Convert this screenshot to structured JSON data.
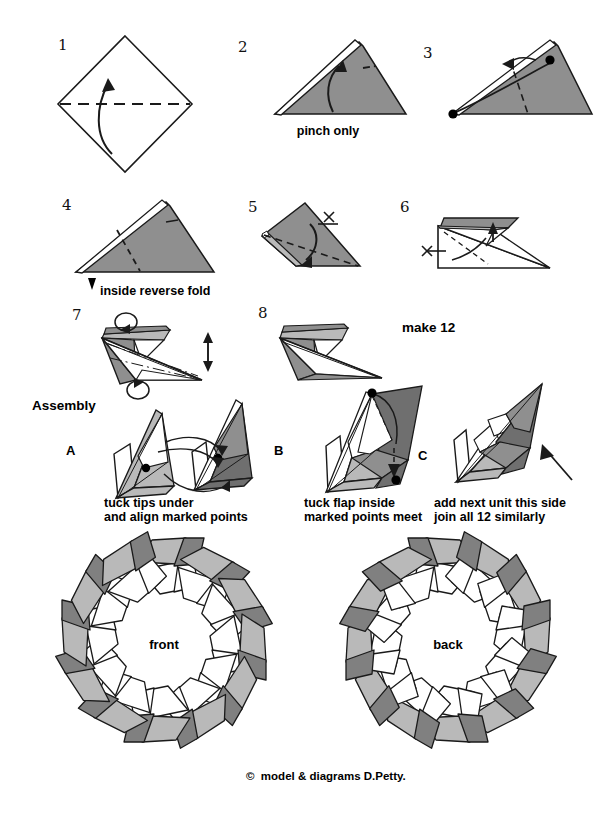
{
  "document": {
    "type": "origami-instruction-diagram",
    "title_text_visible": false,
    "copyright": "©  model & diagrams D.Petty."
  },
  "colors": {
    "paper_dark": "#808080",
    "paper_mid": "#8f8f8f",
    "paper_light": "#b9b9b9",
    "paper_white": "#ffffff",
    "outline": "#1a1a1a",
    "background": "#ffffff"
  },
  "steps": [
    {
      "num": "1",
      "caption": "",
      "icons": [
        "valley-fold-dashed-line",
        "fold-arrow-up"
      ]
    },
    {
      "num": "2",
      "caption": "pinch only",
      "icons": [
        "fold-arrow-up",
        "pinch-mark-dash"
      ]
    },
    {
      "num": "3",
      "caption": "",
      "icons": [
        "marked-point-dot",
        "marked-point-dot",
        "fold-arrow-curved",
        "valley-fold-dashed-line"
      ]
    },
    {
      "num": "4",
      "caption": "inside reverse fold",
      "icons": [
        "push-in-arrowhead",
        "valley-fold-dashed-line"
      ]
    },
    {
      "num": "5",
      "caption": "",
      "icons": [
        "fold-arrow-down",
        "x-mark",
        "valley-fold-dashed-line"
      ]
    },
    {
      "num": "6",
      "caption": "",
      "icons": [
        "fold-arrow-up",
        "fold-arrow-curved",
        "x-mark"
      ]
    },
    {
      "num": "7",
      "caption": "",
      "icons": [
        "rotate-loop-arrow",
        "rotate-loop-arrow",
        "double-headed-arrow"
      ]
    },
    {
      "num": "8",
      "caption": "",
      "icons": []
    }
  ],
  "labels": {
    "make_12": "make 12",
    "assembly": "Assembly"
  },
  "assembly": [
    {
      "letter": "A",
      "caption": "tuck tips under\nand align marked points",
      "icons": [
        "marked-point-dot",
        "marked-point-dot",
        "connect-arrow",
        "connect-arrow"
      ]
    },
    {
      "letter": "B",
      "caption": "tuck flap inside\nmarked points meet",
      "icons": [
        "marked-point-dot",
        "marked-point-dot",
        "fold-arrow-curved"
      ]
    },
    {
      "letter": "C",
      "caption": "add next unit this side\njoin all 12 similarly",
      "icons": [
        "straight-pointer-arrow"
      ]
    }
  ],
  "rings": [
    {
      "label": "front",
      "units": 12
    },
    {
      "label": "back",
      "units": 12
    }
  ]
}
